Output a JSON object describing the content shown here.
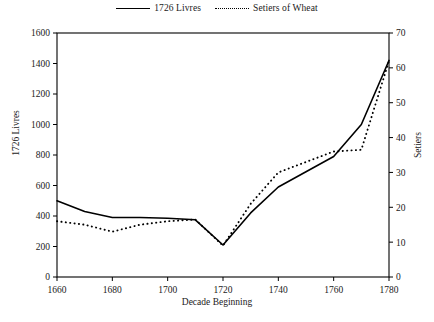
{
  "chart_data": {
    "type": "line",
    "title": "",
    "xlabel": "Decade Beginning",
    "ylabel": "1726 Livres",
    "y2label": "Setiers",
    "x": [
      1660,
      1670,
      1680,
      1690,
      1700,
      1710,
      1720,
      1730,
      1740,
      1750,
      1760,
      1770,
      1780
    ],
    "xlim": [
      1660,
      1780
    ],
    "xticks": [
      1660,
      1680,
      1700,
      1720,
      1740,
      1760,
      1780
    ],
    "ylim": [
      0,
      1600
    ],
    "yticks": [
      0,
      200,
      400,
      600,
      800,
      1000,
      1200,
      1400,
      1600
    ],
    "y2lim": [
      0,
      70
    ],
    "y2ticks": [
      0,
      10,
      20,
      30,
      40,
      50,
      60,
      70
    ],
    "grid": false,
    "legend_position": "top-center",
    "series": [
      {
        "name": "1726 Livres",
        "axis": "left",
        "style": "solid",
        "values": [
          500,
          430,
          390,
          390,
          385,
          375,
          210,
          420,
          590,
          690,
          790,
          1000,
          1420
        ]
      },
      {
        "name": "Setiers of Wheat",
        "axis": "right",
        "style": "dotted",
        "values": [
          16,
          15,
          13,
          15,
          16,
          16.5,
          9,
          21,
          30,
          33,
          36,
          36.5,
          62
        ]
      }
    ]
  },
  "legend": {
    "items": [
      {
        "label": "1726 Livres",
        "key": "solid-line-key"
      },
      {
        "label": "Setiers of Wheat",
        "key": "dotted-line-key"
      }
    ]
  },
  "axes": {
    "left_title": "1726 Livres",
    "right_title": "Setiers",
    "bottom_title": "Decade Beginning"
  }
}
